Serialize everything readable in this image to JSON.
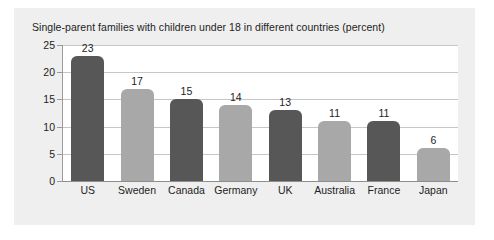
{
  "figure": {
    "title": "Single-parent families with children under 18 in different countries (percent)",
    "panel_color": "#efefef",
    "plot_color": "#ffffff",
    "gridline_color": "#c6c6c6",
    "axis_color": "#8d8d8d",
    "dark_bar_color": "#575757",
    "light_bar_color": "#a8a8a8"
  },
  "chart_data": {
    "type": "bar",
    "title": "Single-parent families with children under 18 in different countries (percent)",
    "xlabel": "",
    "ylabel": "",
    "ylim": [
      0,
      25
    ],
    "yticks": [
      0,
      5,
      10,
      15,
      20,
      25
    ],
    "ytick_labels": [
      "0",
      "5",
      "10",
      "15",
      "20",
      "25"
    ],
    "grid": true,
    "legend": "none",
    "categories": [
      "US",
      "Sweden",
      "Canada",
      "Germany",
      "UK",
      "Australia",
      "France",
      "Japan"
    ],
    "values": [
      23,
      17,
      15,
      14,
      13,
      11,
      11,
      6
    ],
    "value_labels": [
      "23",
      "17",
      "15",
      "14",
      "13",
      "11",
      "11",
      "6"
    ],
    "bar_colors": [
      "#575757",
      "#a8a8a8",
      "#575757",
      "#a8a8a8",
      "#575757",
      "#a8a8a8",
      "#575757",
      "#a8a8a8"
    ]
  }
}
